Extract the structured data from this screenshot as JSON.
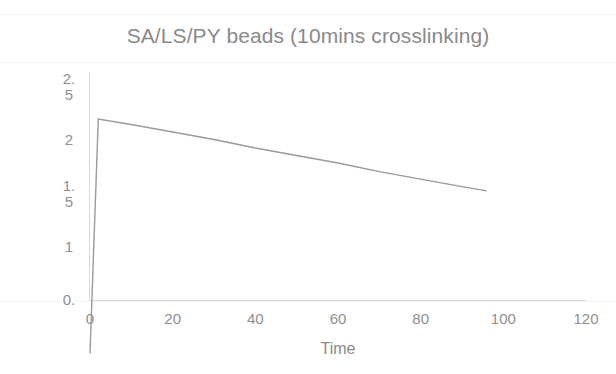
{
  "chart_data": {
    "type": "line",
    "title": "SA/LS/PY beads (10mins crosslinking)",
    "xlabel": "Time",
    "ylabel": "Concentration (mg/ml)",
    "xlim": [
      0,
      120
    ],
    "ylim": [
      0,
      2.5
    ],
    "xticks": [
      "0",
      "20",
      "40",
      "60",
      "80",
      "100",
      "120"
    ],
    "xtick_values": [
      0,
      20,
      40,
      60,
      80,
      100,
      120
    ],
    "yticks": [
      "2.5",
      "2",
      "1.5",
      "1",
      "0."
    ],
    "ytick_values": [
      2.5,
      2,
      1.5,
      1,
      0.5
    ],
    "ytick_lines": [
      {
        "line1": "2.",
        "line2": "5"
      },
      {
        "line1": "2",
        "line2": ""
      },
      {
        "line1": "1.",
        "line2": "5"
      },
      {
        "line1": "1",
        "line2": ""
      },
      {
        "line1": "0.",
        "line2": ""
      }
    ],
    "grid": false,
    "legend": null,
    "series": [
      {
        "name": "SA/LS/PY beads",
        "color": "#9a9a9a",
        "x": [
          0,
          2,
          10,
          20,
          30,
          40,
          50,
          60,
          70,
          80,
          90,
          96
        ],
        "y": [
          0.0,
          2.19,
          2.14,
          2.07,
          2.0,
          1.92,
          1.85,
          1.78,
          1.7,
          1.63,
          1.56,
          1.52
        ]
      }
    ]
  },
  "colors": {
    "text": "#8a8a8a",
    "axis": "#d9d9d9",
    "line": "#9a9a9a",
    "background": "#ffffff"
  }
}
